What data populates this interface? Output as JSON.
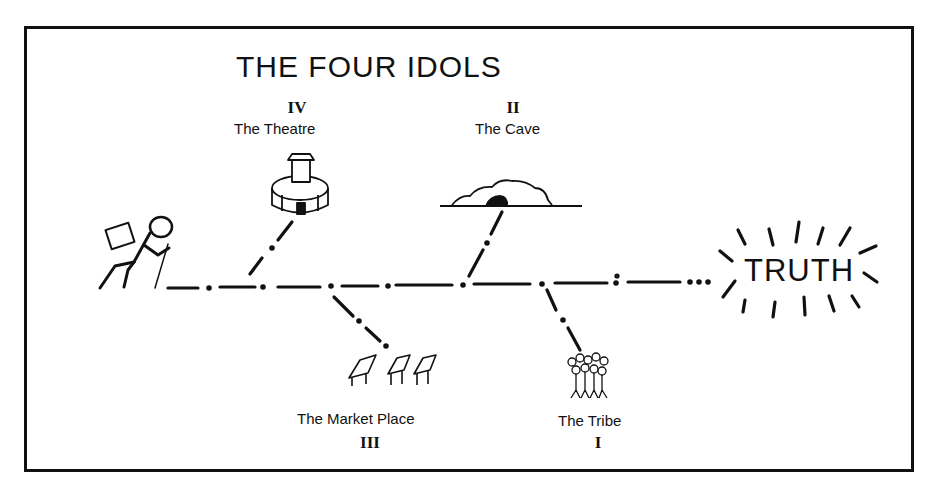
{
  "title": "THE FOUR IDOLS",
  "goal": "TRUTH",
  "idols": [
    {
      "numeral": "I",
      "name": "The Tribe",
      "icon": "crowd-icon",
      "position": "below"
    },
    {
      "numeral": "II",
      "name": "The Cave",
      "icon": "cave-icon",
      "position": "above"
    },
    {
      "numeral": "III",
      "name": "The Market Place",
      "icon": "market-stalls-icon",
      "position": "below"
    },
    {
      "numeral": "IV",
      "name": "The Theatre",
      "icon": "theatre-icon",
      "position": "above"
    }
  ],
  "traveler": {
    "icon": "hiker-icon"
  },
  "colors": {
    "ink": "#111111",
    "background": "#ffffff"
  }
}
